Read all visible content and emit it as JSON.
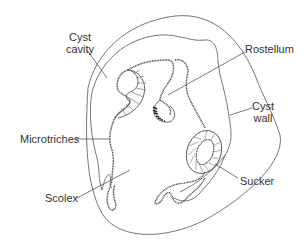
{
  "diagram": {
    "colors": {
      "line": "#555555",
      "text": "#333333",
      "background": "#ffffff"
    },
    "labels": {
      "cyst_cavity": {
        "line1": "Cyst",
        "line2": "cavity"
      },
      "rostellum": "Rostellum",
      "cyst_wall": {
        "line1": "Cyst",
        "line2": "wall"
      },
      "microtriches": "Microtriches",
      "scolex": "Scolex",
      "sucker": "Sucker"
    }
  }
}
